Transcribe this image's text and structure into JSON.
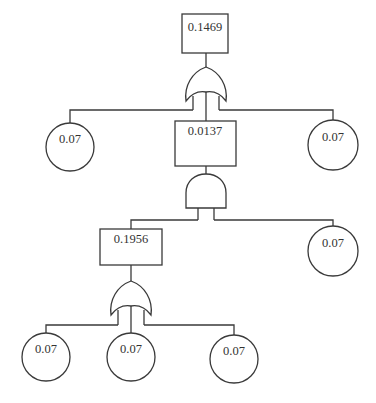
{
  "diagram": {
    "type": "fault-tree",
    "colors": {
      "stroke": "#3a3a3a",
      "text": "#333333",
      "background": "#ffffff"
    },
    "top_event": {
      "label": "0.1469",
      "gate": "OR"
    },
    "level1": {
      "left_basic_event": {
        "label": "0.07"
      },
      "intermediate_event": {
        "label": "0.0137",
        "gate": "AND"
      },
      "right_basic_event": {
        "label": "0.07"
      }
    },
    "level2": {
      "intermediate_event": {
        "label": "0.1956",
        "gate": "OR"
      },
      "right_basic_event": {
        "label": "0.07"
      }
    },
    "level3": {
      "basic_events": [
        {
          "label": "0.07"
        },
        {
          "label": "0.07"
        },
        {
          "label": "0.07"
        }
      ]
    }
  }
}
